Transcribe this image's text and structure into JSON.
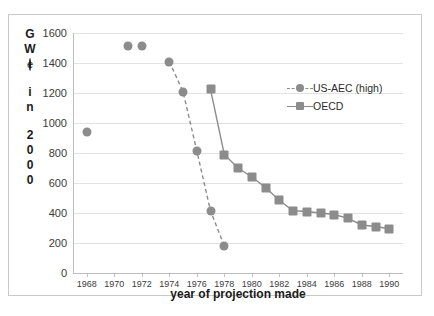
{
  "chart_data": {
    "type": "scatter",
    "title": "",
    "xlabel": "year of projection made",
    "ylabel": "GW(e) in 2000",
    "ylabel_chars": [
      "G",
      "W",
      "(e)",
      "",
      "i",
      "n",
      "",
      "2",
      "0",
      "0",
      "0"
    ],
    "xlim": [
      1967,
      1991
    ],
    "ylim": [
      0,
      1600
    ],
    "ytick_step": 200,
    "xtick_step": 2,
    "yticks": [
      1600,
      1400,
      1200,
      1000,
      800,
      600,
      400,
      200,
      0
    ],
    "xticks": [
      1968,
      1970,
      1972,
      1974,
      1976,
      1978,
      1980,
      1982,
      1984,
      1986,
      1988,
      1990
    ],
    "grid": true,
    "legend_position": "upper right",
    "marker_color": "#8c8c8c",
    "series": [
      {
        "name": "US-AEC (high)",
        "marker": "circle",
        "line": "dashed",
        "x": [
          1968,
          1971,
          1972,
          1974,
          1975,
          1976,
          1977,
          1978
        ],
        "values": [
          940,
          1515,
          1515,
          1410,
          1210,
          815,
          415,
          180
        ]
      },
      {
        "name": "OECD",
        "marker": "square",
        "line": "solid",
        "x": [
          1977,
          1978,
          1979,
          1980,
          1981,
          1982,
          1983,
          1984,
          1985,
          1986,
          1987,
          1988,
          1989,
          1990
        ],
        "values": [
          1225,
          790,
          700,
          640,
          570,
          485,
          415,
          410,
          400,
          390,
          365,
          320,
          310,
          295
        ]
      }
    ]
  },
  "legend": {
    "items": [
      {
        "label": "US-AEC (high)",
        "marker": "circle",
        "line": "dashed"
      },
      {
        "label": "OECD",
        "marker": "square",
        "line": "solid"
      }
    ]
  }
}
